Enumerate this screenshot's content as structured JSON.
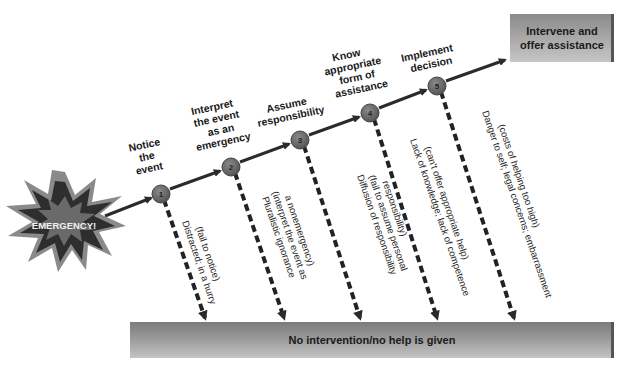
{
  "diagram": {
    "start": {
      "label": "EMERGENCY!",
      "shape": "starburst"
    },
    "steps": [
      {
        "number": "1",
        "label_lines": [
          "Notice",
          "the",
          "event"
        ],
        "failure_lines": [
          "Distracted; in a hurry",
          "(fail to notice)"
        ]
      },
      {
        "number": "2",
        "label_lines": [
          "Interpret",
          "the event",
          "as an",
          "emergency"
        ],
        "failure_lines": [
          "Pluralistic ignorance",
          "(interpret the event as",
          "a nonemergency)"
        ]
      },
      {
        "number": "3",
        "label_lines": [
          "Assume",
          "responsibility"
        ],
        "failure_lines": [
          "Diffusion of responsibility",
          "(fail to assume personal",
          "responsibility)"
        ]
      },
      {
        "number": "4",
        "label_lines": [
          "Know",
          "appropriate",
          "form of",
          "assistance"
        ],
        "failure_lines": [
          "Lack of knowledge; lack of competence",
          "(can't offer appropriate help)"
        ]
      },
      {
        "number": "5",
        "label_lines": [
          "Implement",
          "decision"
        ],
        "failure_lines": [
          "Danger to self; legal concerns; embarrassment",
          "(costs of helping too high)"
        ]
      }
    ],
    "success_box": {
      "lines": [
        "Intervene and",
        "offer assistance"
      ]
    },
    "failure_bar": {
      "label": "No intervention/no help is given"
    },
    "colors": {
      "line": "#2b2b2b",
      "node_fill": "#6e6e6e",
      "box_fill": "#9a9a9a",
      "bar_fill": "#8c8c8c",
      "burst_outer": "#8a8a8a",
      "burst_inner": "#2e2e2e"
    }
  }
}
